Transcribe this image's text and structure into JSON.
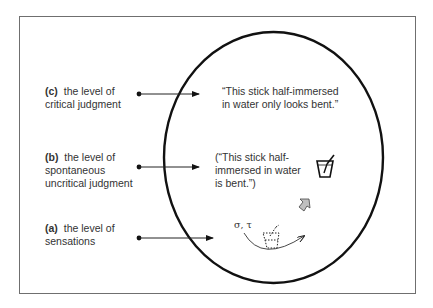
{
  "levels": [
    {
      "id": "c",
      "key": "(c)",
      "line1": "the level of",
      "line2": "critical judgment",
      "line3": ""
    },
    {
      "id": "b",
      "key": "(b)",
      "line1": "the level of",
      "line2": "spontaneous",
      "line3": "uncritical judgment"
    },
    {
      "id": "a",
      "key": "(a)",
      "line1": "the level of",
      "line2": "sensations",
      "line3": ""
    }
  ],
  "statements": {
    "critical": {
      "line1": "“This stick half-immersed",
      "line2": "in water only looks bent.”"
    },
    "uncritical": {
      "line1": "(“This stick half-",
      "line2": "immersed in water",
      "line3": "is bent.”)"
    }
  },
  "sensation_symbols": "σ, τ",
  "icons": {
    "glass": "glass-with-stick-icon",
    "dotted_glass": "dotted-glass-icon",
    "up_arrow": "upward-arrow-icon"
  },
  "colors": {
    "ink": "#111111",
    "text": "#333333",
    "frame": "#6f6f6f",
    "arrow_fill": "#bdbdbd"
  }
}
